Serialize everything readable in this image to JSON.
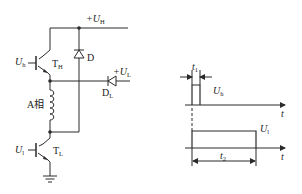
{
  "circuit": {
    "supply_high": {
      "prefix": "+U",
      "sub": "H"
    },
    "supply_low": {
      "prefix": "+U",
      "sub": "L"
    },
    "transistor_high": {
      "name": "T",
      "sub": "H",
      "input": {
        "prefix": "U",
        "sub": "h"
      }
    },
    "transistor_low": {
      "name": "T",
      "sub": "L",
      "input": {
        "prefix": "U",
        "sub": "l"
      }
    },
    "diode_d": "D",
    "diode_dl": {
      "name": "D",
      "sub": "L"
    },
    "winding": "A相"
  },
  "timing": {
    "pulse_high": {
      "label_prefix": "U",
      "label_sub": "h",
      "width_label": {
        "prefix": "t",
        "sub": "1"
      }
    },
    "pulse_low": {
      "label_prefix": "U",
      "label_sub": "l",
      "width_label": {
        "prefix": "t",
        "sub": "2"
      }
    },
    "time_axis_label": "t"
  },
  "colors": {
    "stroke": "#2a2a2a",
    "background": "#ffffff"
  }
}
